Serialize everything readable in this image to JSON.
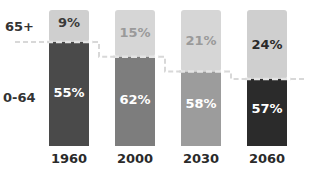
{
  "chart_data": {
    "type": "bar",
    "stacked": true,
    "title": "",
    "xlabel": "",
    "ylabel": "",
    "categories": [
      "1960",
      "2000",
      "2030",
      "2060"
    ],
    "series": [
      {
        "name": "0-64",
        "values": [
          55,
          62,
          58,
          57
        ],
        "labels": [
          "55%",
          "62%",
          "58%",
          "57%"
        ],
        "colors": [
          "#4a4a4a",
          "#7d7d7d",
          "#9c9c9c",
          "#2b2b2b"
        ],
        "label_color": "#ffffff"
      },
      {
        "name": "65+",
        "values": [
          9,
          15,
          21,
          24
        ],
        "labels": [
          "9%",
          "15%",
          "21%",
          "24%"
        ],
        "colors": [
          "#cfcfcf",
          "#d6d6d6",
          "#d6d6d6",
          "#cfcfcf"
        ],
        "label_colors": [
          "#3a3a3a",
          "#9a9a9a",
          "#9a9a9a",
          "#2a2a2a"
        ]
      }
    ],
    "row_labels": [
      "65+",
      "0-64"
    ],
    "grid": false,
    "legend": "left"
  }
}
